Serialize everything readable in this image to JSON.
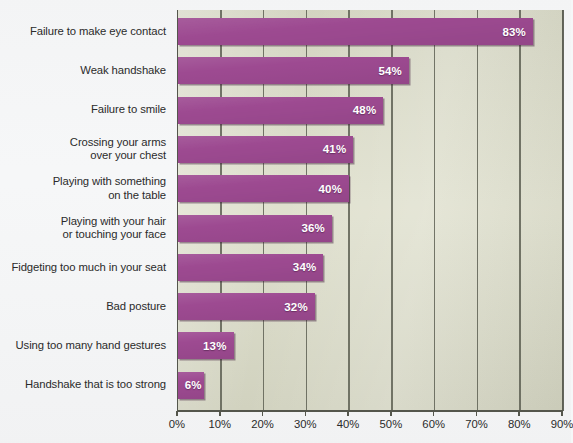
{
  "chart_data": {
    "type": "bar",
    "orientation": "horizontal",
    "title": "",
    "subtitle": "",
    "xlabel": "",
    "ylabel": "",
    "xlim": [
      0,
      90
    ],
    "xtick_labels": [
      "0%",
      "10%",
      "20%",
      "30%",
      "40%",
      "50%",
      "60%",
      "70%",
      "80%",
      "90%"
    ],
    "xticks": [
      0,
      10,
      20,
      30,
      40,
      50,
      60,
      70,
      80,
      90
    ],
    "grid": true,
    "legend": false,
    "value_label_suffix": "%",
    "categories": [
      "Failure to make eye contact",
      "Weak handshake",
      "Failure to smile",
      "Crossing your arms over your chest",
      "Playing with something on the table",
      "Playing with your hair or touching your face",
      "Fidgeting too much in your seat",
      "Bad posture",
      "Using too many hand gestures",
      "Handshake that is too strong"
    ],
    "values": [
      83,
      54,
      48,
      41,
      40,
      36,
      34,
      32,
      13,
      6
    ],
    "value_labels": [
      "83%",
      "54%",
      "48%",
      "41%",
      "40%",
      "36%",
      "34%",
      "32%",
      "13%",
      "6%"
    ],
    "category_lines": [
      [
        "Failure to make eye contact"
      ],
      [
        "Weak handshake"
      ],
      [
        "Failure to smile"
      ],
      [
        "Crossing your arms",
        "over your chest"
      ],
      [
        "Playing with something",
        "on the table"
      ],
      [
        "Playing with your hair",
        "or touching your face"
      ],
      [
        "Fidgeting too much in your seat"
      ],
      [
        "Bad posture"
      ],
      [
        "Using too many hand gestures"
      ],
      [
        "Handshake that is too strong"
      ]
    ],
    "colors": {
      "bar": "#9d4a91",
      "plot_background": "#dcddc9",
      "page_background": "#f6f7f8",
      "gridline": "#5e6054",
      "axis": "#54564c",
      "value_label_text": "#ffffff",
      "category_label_text": "#2b2b2b"
    }
  }
}
